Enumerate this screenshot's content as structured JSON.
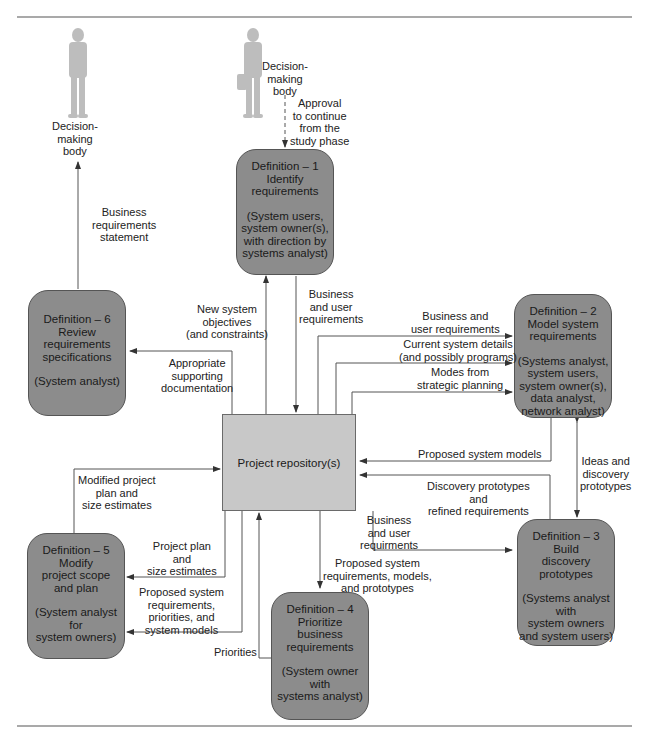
{
  "diagram": {
    "actors": [
      {
        "id": "decision-body-left",
        "label": "Decision-\nmaking\nbody"
      },
      {
        "id": "decision-body-top",
        "label": "Decision-\nmaking\nbody"
      }
    ],
    "repository": {
      "label": "Project repository(s)"
    },
    "processes": [
      {
        "id": "def1",
        "title": "Definition – 1\nIdentify\nrequirements",
        "roles": "(System users,\nsystem owner(s),\nwith direction by\nsystems analyst)"
      },
      {
        "id": "def2",
        "title": "Definition – 2\nModel system\nrequirements",
        "roles": "(Systems analyst,\nsystem users,\nsystem owner(s),\ndata analyst,\nnetwork analyst)"
      },
      {
        "id": "def3",
        "title": "Definition – 3\nBuild\ndiscovery\nprototypes",
        "roles": "(Systems analyst\nwith\nsystem owners\nand system users)"
      },
      {
        "id": "def4",
        "title": "Definition – 4\nPrioritize\nbusiness\nrequirements",
        "roles": "(System owner\nwith\nsystems analyst)"
      },
      {
        "id": "def5",
        "title": "Definition – 5\nModify\nproject scope\nand plan",
        "roles": "(System analyst\nfor\nsystem owners)"
      },
      {
        "id": "def6",
        "title": "Definition – 6\nReview\nrequirements\nspecifications",
        "roles": "(System analyst)"
      }
    ],
    "flows": {
      "approval": "Approval\nto continue\nfrom the\nstudy phase",
      "business_req_statement": "Business\nrequirements\nstatement",
      "new_objectives": "New system\nobjectives\n(and constraints)",
      "business_user_req_1": "Business\nand user\nrequirements",
      "business_user_req_2": "Business and\nuser requirements",
      "current_system": "Current system details\n(and possibly programs)",
      "modes_strategic": "Modes from\nstrategic planning",
      "supporting_doc": "Appropriate\nsupporting\ndocumentation",
      "proposed_models": "Proposed system models",
      "ideas_prototypes": "Ideas and\ndiscovery\nprototypes",
      "discovery_refined": "Discovery prototypes\nand\nrefined requirements",
      "business_user_req_3": "Business\nand user\nrequirments",
      "proposed_req_models_proto": "Proposed system\nrequirements, models,\nand prototypes",
      "modified_plan": "Modified project\nplan and\nsize estimates",
      "plan_size": "Project plan\nand\nsize estimates",
      "proposed_req_priorities": "Proposed system\nrequirements,\npriorities, and\nsystem models",
      "priorities": "Priorities"
    },
    "colors": {
      "process_fill": "#8c8c8c",
      "repository_fill": "#c8c8c8",
      "line": "#555555",
      "rule": "#a9a9a9"
    }
  }
}
